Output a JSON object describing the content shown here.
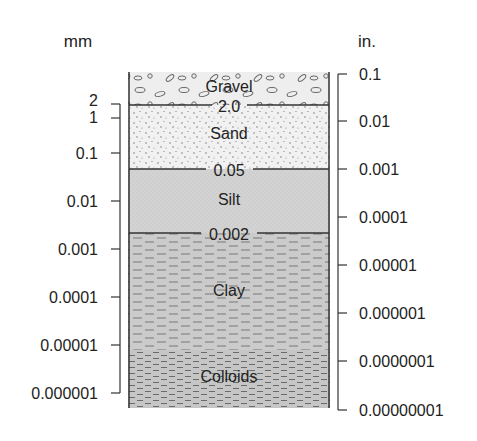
{
  "diagram": {
    "left_axis": {
      "unit_label": "mm",
      "ticks": [
        {
          "label": "2",
          "y": 104
        },
        {
          "label": "1",
          "y": 118
        },
        {
          "label": "0.1",
          "y": 153
        },
        {
          "label": "0.01",
          "y": 201
        },
        {
          "label": "0.001",
          "y": 249
        },
        {
          "label": "0.0001",
          "y": 297
        },
        {
          "label": "0.00001",
          "y": 345
        },
        {
          "label": "0.000001",
          "y": 393
        }
      ]
    },
    "right_axis": {
      "unit_label": "in.",
      "ticks": [
        {
          "label": "0.1",
          "y": 74
        },
        {
          "label": "0.01",
          "y": 121
        },
        {
          "label": "0.001",
          "y": 169
        },
        {
          "label": "0.0001",
          "y": 217
        },
        {
          "label": "0.00001",
          "y": 265
        },
        {
          "label": "0.000001",
          "y": 313
        },
        {
          "label": "0.0000001",
          "y": 361
        },
        {
          "label": "0.00000001",
          "y": 410
        }
      ]
    },
    "layers": [
      {
        "name": "Gravel",
        "top": 72,
        "bottom": 105,
        "fill": "#eeeeee"
      },
      {
        "name": "Sand",
        "top": 105,
        "bottom": 169,
        "fill": "#f1f1f1"
      },
      {
        "name": "Silt",
        "top": 169,
        "bottom": 233,
        "fill": "#d2d2d2"
      },
      {
        "name": "Clay",
        "top": 233,
        "bottom": 350,
        "fill": "#c9c9c9"
      },
      {
        "name": "Colloids",
        "top": 350,
        "bottom": 408,
        "fill": "#c4c4c4"
      }
    ],
    "boundaries": [
      {
        "label": "2.0",
        "y": 105
      },
      {
        "label": "0.05",
        "y": 169
      },
      {
        "label": "0.002",
        "y": 233
      }
    ],
    "colors": {
      "line": "#333333",
      "text": "#222222"
    }
  }
}
